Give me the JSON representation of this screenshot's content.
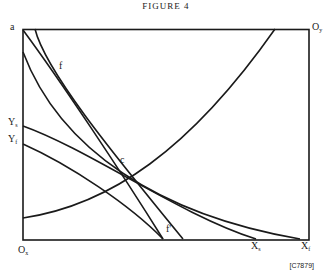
{
  "figure": {
    "title": "FIGURE 4",
    "reference": "[C7879]"
  },
  "labels": {
    "a": "a",
    "oy": {
      "main": "O",
      "sub": "y"
    },
    "ox": {
      "main": "O",
      "sub": "x"
    },
    "ys": {
      "main": "Y",
      "sub": "s"
    },
    "yf": {
      "main": "Y",
      "sub": "f"
    },
    "xs": {
      "main": "X",
      "sub": "s"
    },
    "xf": {
      "main": "X",
      "sub": "f"
    },
    "f": "f",
    "f_prime": "f'",
    "c": "c"
  },
  "colors": {
    "line": "#1a1a1a",
    "background": "#ffffff"
  }
}
